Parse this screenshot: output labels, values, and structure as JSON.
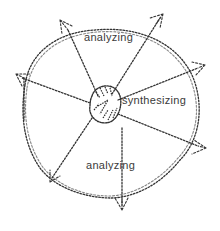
{
  "diagram": {
    "labels": {
      "top": "analyzing",
      "center": "synthesizing",
      "bottom": "analyzing"
    },
    "colors": {
      "stroke": "#333333",
      "text": "#3a3a3a",
      "background": "#ffffff"
    },
    "elements": {
      "outer_circle": "outer-analyzing-circle",
      "center_blob": "synthesizing-core",
      "arrows": [
        "top-left",
        "top-right",
        "right",
        "left",
        "bottom-right",
        "bottom",
        "bottom-left"
      ]
    }
  }
}
